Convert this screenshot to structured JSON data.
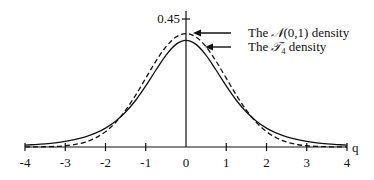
{
  "chart_data": {
    "type": "line",
    "title": "",
    "xlabel": "q",
    "ylabel": "",
    "xlim": [
      -4,
      4
    ],
    "ylim": [
      0,
      0.45
    ],
    "grid": false,
    "x_ticks": [
      "-4",
      "-3",
      "-2",
      "-1",
      "0",
      "1",
      "2",
      "3",
      "4"
    ],
    "y_ticks": [
      "0.45"
    ],
    "legend_position": "top-right, with arrows pointing to curves",
    "x": [
      0,
      0.25,
      0.5,
      0.75,
      1,
      1.25,
      1.5,
      1.75,
      2,
      2.25,
      2.5,
      2.75,
      3,
      3.25,
      3.5,
      3.75,
      4
    ],
    "symmetric_about_zero": true,
    "series": [
      {
        "name": "The N(0,1) density",
        "legend_label_prefix": "The ",
        "legend_symbol": "𝒩",
        "legend_label_suffix": "(0,1) density",
        "style": "dashed",
        "values": [
          0.3989,
          0.3867,
          0.3521,
          0.3011,
          0.242,
          0.1826,
          0.1295,
          0.0863,
          0.054,
          0.0317,
          0.0175,
          0.0091,
          0.0044,
          0.002,
          0.0009,
          0.0004,
          0.0001
        ]
      },
      {
        "name": "The T4 density",
        "legend_label_prefix": "The ",
        "legend_symbol": "𝒯",
        "legend_subscript": "4",
        "legend_label_suffix": " density",
        "style": "solid",
        "values": [
          0.375,
          0.3608,
          0.3223,
          0.2699,
          0.2147,
          0.1644,
          0.1229,
          0.0905,
          0.0663,
          0.0485,
          0.0357,
          0.0264,
          0.0197,
          0.0148,
          0.0113,
          0.0087,
          0.0067
        ]
      }
    ]
  },
  "layout": {
    "origin_x": 186,
    "origin_y": 147,
    "px_per_unit_x": 40.25,
    "px_per_unit_y": 284.4,
    "y_axis_top": 11
  }
}
